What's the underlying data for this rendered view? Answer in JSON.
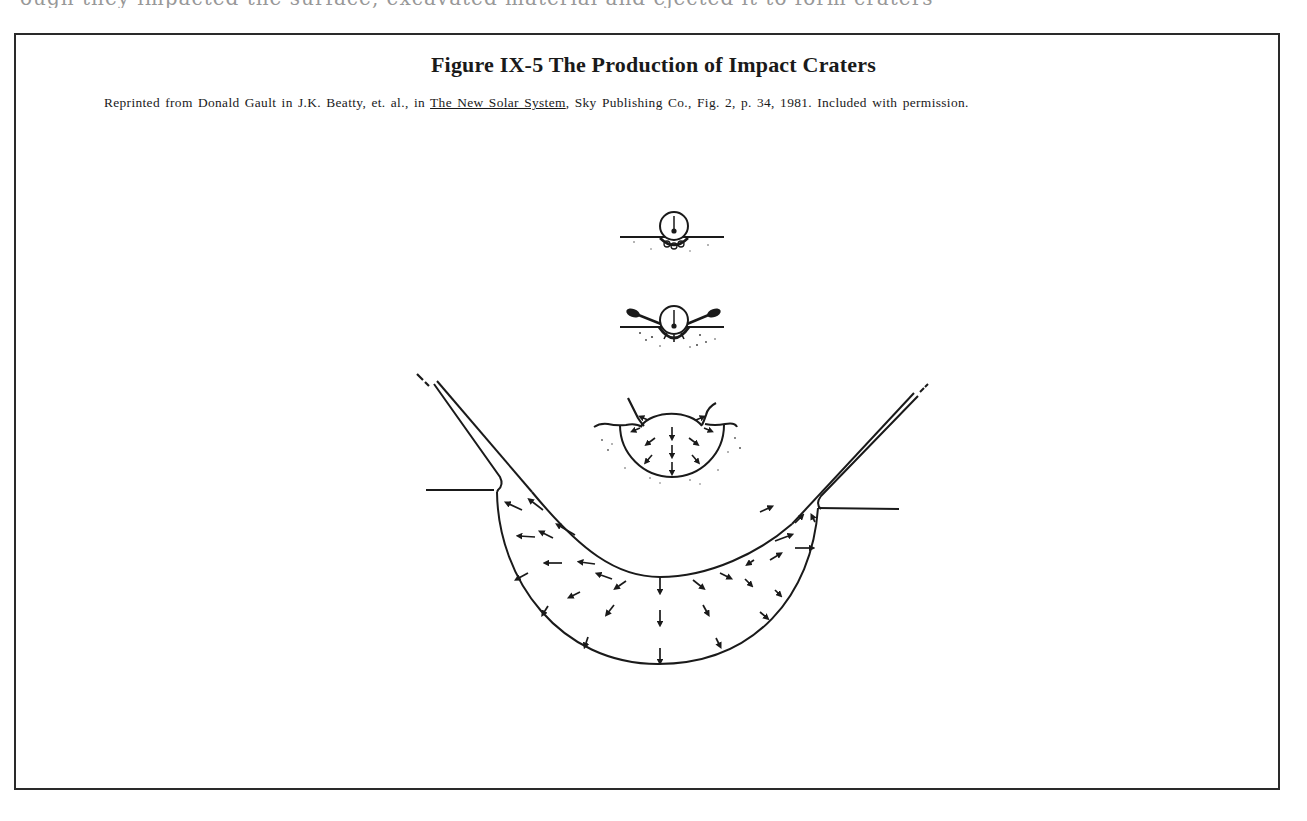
{
  "page": {
    "top_partial_text": "ough they impacted the surface, excavated material and ejected it to form craters"
  },
  "figure": {
    "label": "Figure IX-5",
    "title": "Figure IX-5  The Production of Impact Craters",
    "caption": {
      "prefix": "Reprinted from Donald Gault in J.K. Beatty, et. al., in ",
      "book_title": "The New Solar System",
      "suffix": ", Sky Publishing Co., Fig. 2, p. 34, 1981. Included with permission."
    },
    "illustration": {
      "description": "Four sequential stages of impact crater formation, from projectile contact to fully excavated transient crater with ejecta curtain",
      "stages": [
        {
          "index": 1,
          "name": "contact-and-compression",
          "description": "Projectile touching the surface, shock begins beneath it"
        },
        {
          "index": 2,
          "name": "early-excavation",
          "description": "Projectile penetrating, jets of material ejected sideways"
        },
        {
          "index": 3,
          "name": "excavation-flow",
          "description": "Growing bowl with radial flow arrows and rising ejecta lips"
        },
        {
          "index": 4,
          "name": "transient-crater",
          "description": "Large bowl-shaped crater with ejecta curtain rising on both sides and radial flow arrows"
        }
      ]
    }
  }
}
